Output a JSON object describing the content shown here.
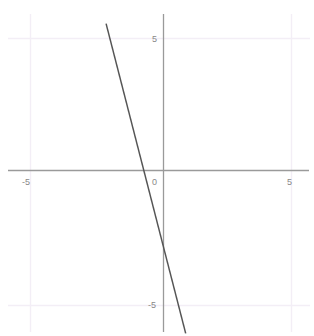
{
  "chart_data": {
    "type": "line",
    "title": "",
    "xlabel": "",
    "ylabel": "",
    "xlim": [
      -6.2,
      5.75
    ],
    "ylim": [
      -6.3,
      5.5
    ],
    "grid": true,
    "grid_lines": {
      "vertical": [
        -5,
        5
      ],
      "horizontal": [
        -5,
        5
      ]
    },
    "legend": "none",
    "axes": {
      "x_axis_at_y": 0,
      "y_axis_at_x": 0,
      "origin_label": "0"
    },
    "tick_labels": {
      "x": [
        "-5",
        "5"
      ],
      "y": [
        "5",
        "-5"
      ],
      "x_values": [
        -5,
        5
      ],
      "y_values": [
        5,
        -5
      ]
    },
    "series": [
      {
        "name": "line",
        "type": "line",
        "slope": -3.7,
        "intercept": -3.3,
        "x_intercept": -0.9,
        "y_intercept": -3.3,
        "points": [
          [
            -2.2,
            5.5
          ],
          [
            0.85,
            -6.1
          ]
        ]
      }
    ],
    "colors": {
      "line": "#555555",
      "axis": "#9a9a9a",
      "grid": "#f2eef5",
      "label": "#888888",
      "background": "#ffffff"
    }
  },
  "labels": {
    "y_positive": "5",
    "y_negative": "-5",
    "x_negative": "-5",
    "x_positive": "5",
    "origin": "0"
  }
}
